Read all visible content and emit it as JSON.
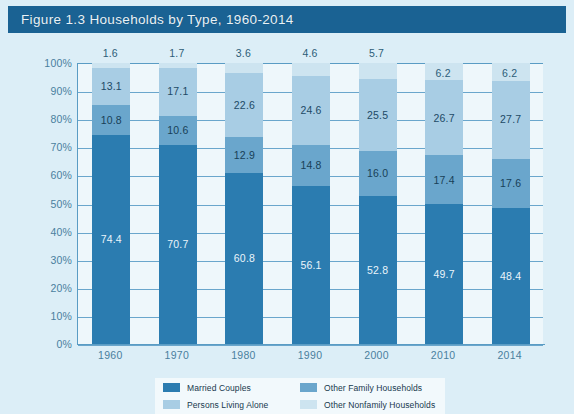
{
  "figure": {
    "title": "Figure 1.3   Households by Type, 1960-2014",
    "banner_color": "#1a6293",
    "background_color": "#dceef7",
    "plot_background_color": "#eef7fb"
  },
  "axes": {
    "y_ticks": [
      "100%",
      "90%",
      "80%",
      "70%",
      "60%",
      "50%",
      "40%",
      "30%",
      "20%",
      "10%",
      "0%"
    ],
    "x_ticks": [
      "1960",
      "1970",
      "1980",
      "1990",
      "2000",
      "2010",
      "2014"
    ]
  },
  "legend": {
    "items": [
      {
        "label": "Married Couples",
        "color": "#2b7cb0"
      },
      {
        "label": "Other Family Households",
        "color": "#6aa6cc"
      },
      {
        "label": "Persons Living Alone",
        "color": "#a8cde4"
      },
      {
        "label": "Other Nonfamily Households",
        "color": "#cde4f0"
      }
    ]
  },
  "chart_data": {
    "type": "bar",
    "stacked": true,
    "title": "Households by Type, 1960-2014",
    "xlabel": "",
    "ylabel": "",
    "ylim": [
      0,
      100
    ],
    "ytick_step": 10,
    "grid": true,
    "legend_position": "bottom",
    "categories": [
      "1960",
      "1970",
      "1980",
      "1990",
      "2000",
      "2010",
      "2014"
    ],
    "series": [
      {
        "name": "Married Couples",
        "color": "#2b7cb0",
        "values": [
          74.4,
          70.7,
          60.8,
          56.1,
          52.8,
          49.7,
          48.4
        ]
      },
      {
        "name": "Other Family Households",
        "color": "#6aa6cc",
        "values": [
          10.8,
          10.6,
          12.9,
          14.8,
          16.0,
          17.4,
          17.6
        ]
      },
      {
        "name": "Persons Living Alone",
        "color": "#a8cde4",
        "values": [
          13.1,
          17.1,
          22.6,
          24.6,
          25.5,
          26.7,
          27.7
        ]
      },
      {
        "name": "Other Nonfamily Households",
        "color": "#cde4f0",
        "values": [
          1.6,
          1.7,
          3.6,
          4.6,
          5.7,
          6.2,
          6.2
        ]
      }
    ],
    "labels": {
      "married": [
        "74.4",
        "70.7",
        "60.8",
        "56.1",
        "52.8",
        "49.7",
        "48.4"
      ],
      "other_family": [
        "10.8",
        "10.6",
        "12.9",
        "14.8",
        "16.0",
        "17.4",
        "17.6"
      ],
      "living_alone": [
        "13.1",
        "17.1",
        "22.6",
        "24.6",
        "25.5",
        "26.7",
        "27.7"
      ],
      "other_nonfamily": [
        "1.6",
        "1.7",
        "3.6",
        "4.6",
        "5.7",
        "6.2",
        "6.2"
      ]
    }
  }
}
